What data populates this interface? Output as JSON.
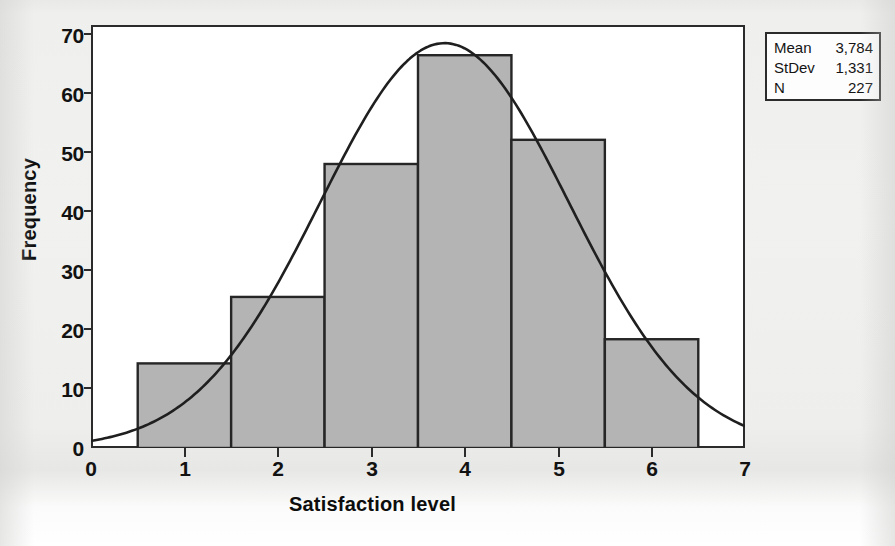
{
  "chart_data": {
    "type": "bar",
    "title": "",
    "xlabel": "Satisfaction level",
    "ylabel": "Frequency",
    "categories": [
      "1",
      "2",
      "3",
      "4",
      "5",
      "6"
    ],
    "values": [
      14,
      25,
      47,
      65,
      51,
      18
    ],
    "bin_edges": [
      0.5,
      1.5,
      2.5,
      3.5,
      4.5,
      5.5,
      6.5
    ],
    "xlim": [
      0,
      7
    ],
    "ylim": [
      0,
      70
    ],
    "xticks": [
      "0",
      "1",
      "2",
      "3",
      "4",
      "5",
      "6",
      "7"
    ],
    "yticks": [
      "0",
      "10",
      "20",
      "30",
      "40",
      "50",
      "60",
      "70"
    ],
    "grid": false,
    "legend_position": "top-right-outside",
    "overlay": {
      "type": "line",
      "name": "normal-fit-curve",
      "mean": 3.784,
      "stdev": 1.331,
      "n": 227,
      "peak_value": 67
    },
    "bar_fill_color": "#b4b4b4",
    "bar_edge_color": "#262626",
    "curve_color": "#1f1f1f"
  },
  "stats_box": {
    "rows": [
      {
        "key": "Mean",
        "value": "3,784"
      },
      {
        "key": "StDev",
        "value": "1,331"
      },
      {
        "key": "N",
        "value": "227"
      }
    ]
  }
}
